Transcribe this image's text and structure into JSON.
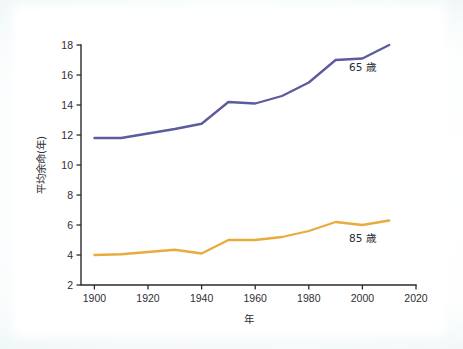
{
  "figure": {
    "background_color": "#f4fafb",
    "plot_background_color": "#ffffff"
  },
  "chart_data": {
    "type": "line",
    "title": "",
    "subtitle": "",
    "xlabel": "年",
    "ylabel": "平均余命(年)",
    "xlim": [
      1895,
      2020
    ],
    "ylim": [
      2,
      18
    ],
    "xticks": [
      1900,
      1920,
      1940,
      1960,
      1980,
      2000,
      2020
    ],
    "xtick_labels": [
      "1900",
      "1920",
      "1940",
      "1960",
      "1980",
      "2000",
      "2020"
    ],
    "yticks": [
      2,
      4,
      6,
      8,
      10,
      12,
      14,
      16,
      18
    ],
    "ytick_labels": [
      "2",
      "4",
      "6",
      "8",
      "10",
      "12",
      "14",
      "16",
      "18"
    ],
    "grid": false,
    "legend_position": "inline-right-of-line",
    "x": [
      1900,
      1910,
      1920,
      1930,
      1940,
      1950,
      1960,
      1970,
      1980,
      1990,
      2000,
      2010
    ],
    "series": [
      {
        "name": "65 歳",
        "color": "#5b5b9e",
        "label_x": 2000,
        "label_y": 16.3,
        "values": [
          11.8,
          11.8,
          12.1,
          12.4,
          12.75,
          14.2,
          14.1,
          14.6,
          15.5,
          17.0,
          17.1,
          18.0
        ]
      },
      {
        "name": "85 歳",
        "color": "#e8ab3c",
        "label_x": 2000,
        "label_y": 4.85,
        "values": [
          4.0,
          4.05,
          4.2,
          4.35,
          4.1,
          5.0,
          5.0,
          5.2,
          5.6,
          6.2,
          6.0,
          6.3
        ]
      }
    ]
  }
}
